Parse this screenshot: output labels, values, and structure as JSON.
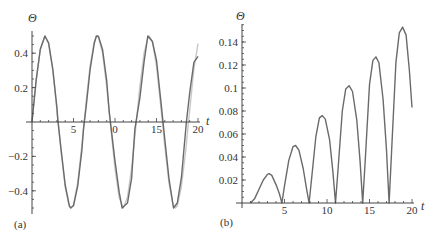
{
  "chart_data": [
    {
      "panel": "(a)",
      "type": "line",
      "title": "",
      "xlabel": "t",
      "ylabel": "Θ",
      "xlim": [
        0,
        20
      ],
      "ylim": [
        -0.52,
        0.52
      ],
      "x_ticks": [
        5,
        10,
        15,
        20
      ],
      "x_tick_labels": [
        "5",
        "0",
        "15",
        "20"
      ],
      "y_ticks": [
        -0.4,
        -0.2,
        0.2,
        0.4
      ],
      "y_tick_labels": [
        "-0.4",
        "-0.2",
        "0.2",
        "0.4"
      ],
      "grid": false,
      "legend": null,
      "series": [
        {
          "name": "light curve",
          "color": "#c8c8c8",
          "formula": "0.5*sin(t)",
          "x": [
            0,
            0.5,
            1,
            1.5707,
            2,
            2.5,
            3,
            3.1416,
            3.5,
            4,
            4.5,
            4.7124,
            5,
            5.5,
            6,
            6.2832,
            6.5,
            7,
            7.5,
            7.854,
            8,
            8.5,
            9,
            9.4248,
            10,
            10.5,
            10.9956,
            11.5,
            12,
            12.566,
            13,
            13.5,
            14,
            14.137,
            14.5,
            15,
            15.708,
            16,
            16.5,
            17,
            17.279,
            17.5,
            18,
            18.5,
            18.85,
            19.5,
            20
          ],
          "y": [
            0,
            0.24,
            0.421,
            0.5,
            0.455,
            0.299,
            0.071,
            0,
            -0.175,
            -0.378,
            -0.489,
            -0.5,
            -0.479,
            -0.353,
            -0.14,
            0,
            0.108,
            0.328,
            0.469,
            0.5,
            0.495,
            0.399,
            0.206,
            0,
            -0.272,
            -0.44,
            -0.5,
            -0.438,
            -0.268,
            0,
            0.21,
            0.402,
            0.495,
            0.5,
            0.467,
            0.325,
            0,
            -0.144,
            -0.356,
            -0.481,
            -0.5,
            -0.488,
            -0.375,
            -0.172,
            0,
            0.308,
            0.456
          ]
        },
        {
          "name": "dark curve",
          "color": "#6a6a6a",
          "x": [
            0,
            0.5,
            1,
            1.55,
            2,
            2.5,
            3,
            3.1,
            3.5,
            4,
            4.5,
            4.65,
            5,
            5.5,
            6,
            6.2,
            6.5,
            7,
            7.5,
            7.75,
            8,
            8.5,
            9,
            9.3,
            10,
            10.5,
            10.85,
            11.5,
            12,
            12.4,
            13,
            13.5,
            13.95,
            14.5,
            15,
            15.5,
            16,
            16.5,
            17.05,
            17.5,
            18,
            18.6,
            19,
            19.5,
            20
          ],
          "y": [
            0,
            0.24,
            0.423,
            0.5,
            0.46,
            0.308,
            0.085,
            0.02,
            -0.16,
            -0.366,
            -0.486,
            -0.5,
            -0.487,
            -0.373,
            -0.168,
            -0.04,
            0.08,
            0.304,
            0.458,
            0.5,
            0.498,
            0.42,
            0.24,
            0.06,
            -0.228,
            -0.408,
            -0.5,
            -0.471,
            -0.328,
            -0.04,
            0.142,
            0.351,
            0.5,
            0.468,
            0.359,
            0.13,
            -0.1,
            -0.33,
            -0.5,
            -0.471,
            -0.324,
            0,
            0.17,
            0.347,
            0.382
          ]
        }
      ]
    },
    {
      "panel": "(b)",
      "type": "line",
      "title": "",
      "xlabel": "t",
      "ylabel": "Θ",
      "xlim": [
        0,
        20
      ],
      "ylim": [
        0,
        0.155
      ],
      "x_ticks": [
        5,
        10,
        15,
        20
      ],
      "x_tick_labels": [
        "5",
        "10",
        "15",
        "20"
      ],
      "y_ticks": [
        0.02,
        0.04,
        0.06,
        0.08,
        0.1,
        0.12,
        0.14
      ],
      "y_tick_labels": [
        "0.02",
        "0.04",
        "0.06",
        "0.08",
        "0.1",
        "0.12",
        "0.14"
      ],
      "grid": false,
      "legend": null,
      "series": [
        {
          "name": "difference",
          "color": "#6a6a6a",
          "x": [
            1.0,
            1.5,
            2.0,
            2.5,
            3.0,
            3.2,
            3.5,
            4.0,
            4.4,
            4.7,
            5.0,
            5.5,
            6.0,
            6.3,
            6.7,
            7.2,
            7.6,
            7.9,
            8.2,
            8.7,
            9.1,
            9.45,
            9.8,
            10.3,
            10.7,
            11.0,
            11.3,
            11.8,
            12.2,
            12.6,
            13.0,
            13.5,
            13.9,
            14.2,
            14.5,
            15.0,
            15.4,
            15.75,
            16.1,
            16.6,
            17.0,
            17.3,
            17.6,
            18.1,
            18.5,
            18.9,
            19.3,
            19.7,
            20.0
          ],
          "y": [
            0,
            0.004,
            0.012,
            0.02,
            0.025,
            0.0255,
            0.024,
            0.016,
            0.008,
            0,
            0.015,
            0.037,
            0.049,
            0.05,
            0.046,
            0.03,
            0.012,
            0,
            0.022,
            0.058,
            0.074,
            0.076,
            0.073,
            0.055,
            0.027,
            0,
            0.03,
            0.08,
            0.099,
            0.102,
            0.097,
            0.072,
            0.036,
            0,
            0.038,
            0.103,
            0.124,
            0.127,
            0.122,
            0.09,
            0.046,
            0,
            0.045,
            0.122,
            0.148,
            0.153,
            0.146,
            0.115,
            0.083
          ]
        }
      ]
    }
  ],
  "labels": {
    "panel_a": "(a)",
    "panel_b": "(b)",
    "y_axis_a": "Θ",
    "x_axis_a": "t",
    "y_axis_b": "Θ",
    "x_axis_b": "t"
  }
}
